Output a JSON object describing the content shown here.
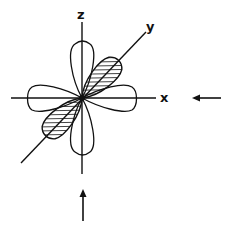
{
  "diagram": {
    "axes": {
      "z_label": "z",
      "y_label": "y",
      "x_label": "x"
    },
    "lobes": {
      "unshaded": [
        "+z lobe",
        "-z lobe",
        "+x lobe",
        "-x lobe"
      ],
      "shaded": [
        "+y lobe (hatched)",
        "-y lobe (hatched)"
      ]
    },
    "arrows": [
      {
        "name": "view-from-right",
        "direction": "pointing left toward x axis"
      },
      {
        "name": "view-from-below",
        "direction": "pointing up toward z axis"
      }
    ],
    "colors": {
      "ink": "#111111",
      "background": "#ffffff"
    }
  }
}
